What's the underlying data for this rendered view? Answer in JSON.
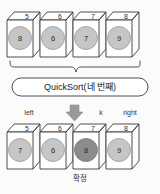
{
  "diagram": {
    "colors": {
      "background": "#fbfbfb",
      "stroke": "#3a3a3a",
      "box_face": "#ffffff",
      "box_top": "#fdfdfd",
      "circle_normal": "#c6c6c6",
      "circle_highlight": "#8c8c8c",
      "arrow": "#9a9a9a",
      "text": "#2b2b2b"
    }
  },
  "before": {
    "label": "before-array",
    "indices": [
      "5",
      "6",
      "7",
      "8"
    ],
    "values": [
      "8",
      "6",
      "7",
      "9"
    ],
    "highlight_index": -1
  },
  "operation": {
    "label": "QuickSort(네 번째)"
  },
  "pointers": {
    "left": "left",
    "k": "k",
    "right": "right"
  },
  "after": {
    "label": "after-array",
    "indices": [
      "5",
      "6",
      "7",
      "8"
    ],
    "values": [
      "7",
      "6",
      "8",
      "9"
    ],
    "highlight_index": 2
  },
  "caption": {
    "fixed": "확정"
  }
}
